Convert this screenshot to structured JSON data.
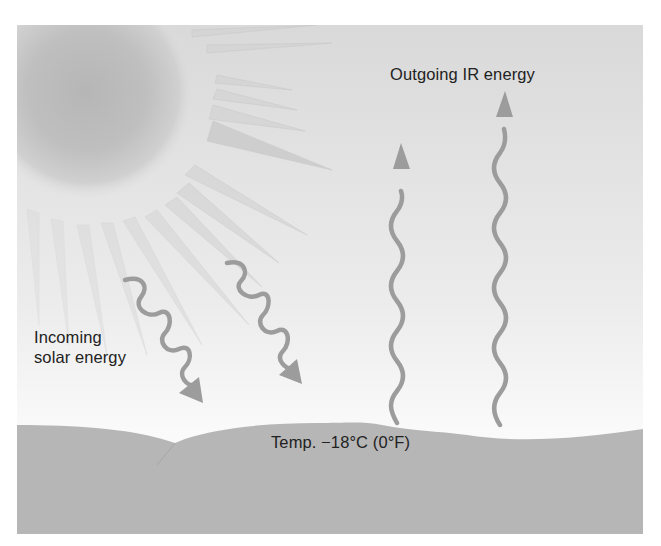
{
  "diagram": {
    "labels": {
      "outgoing": "Outgoing IR energy",
      "incoming_line1": "Incoming",
      "incoming_line2": "solar energy",
      "temperature": "Temp. −18°C (0°F)"
    },
    "colors": {
      "sky_top": "#dcdcdc",
      "sky_bottom": "#fbfbfb",
      "sun_core": "#b9b9b9",
      "sun_edge": "#e2e2e2",
      "ray": "#cfcfcf",
      "arrow": "#9a9a9a",
      "ground": "#b5b5b5",
      "text": "#222222"
    },
    "elements": {
      "sun": "sun-icon",
      "incoming_arrows": 2,
      "outgoing_arrows": 2,
      "ground": "earth-surface"
    }
  }
}
